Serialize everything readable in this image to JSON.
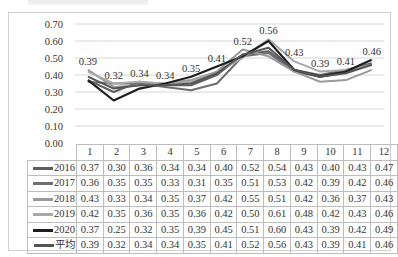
{
  "chart_data": {
    "type": "line",
    "title": "",
    "xlabel": "",
    "ylabel": "",
    "ylim": [
      0,
      0.7
    ],
    "yticks": [
      "0.70",
      "0.60",
      "0.50",
      "0.40",
      "0.30",
      "0.20",
      "0.10",
      "0.00"
    ],
    "grid": true,
    "legend_position": "data-table (bottom)",
    "categories": [
      "1",
      "2",
      "3",
      "4",
      "5",
      "6",
      "7",
      "8",
      "9",
      "10",
      "11",
      "12"
    ],
    "series": [
      {
        "name": "2016",
        "color": "#5f5f5f",
        "values": [
          0.37,
          0.3,
          0.36,
          0.34,
          0.34,
          0.4,
          0.52,
          0.54,
          0.43,
          0.4,
          0.43,
          0.47
        ]
      },
      {
        "name": "2017",
        "color": "#6e6e6e",
        "values": [
          0.36,
          0.35,
          0.35,
          0.33,
          0.31,
          0.35,
          0.51,
          0.53,
          0.42,
          0.39,
          0.42,
          0.46
        ]
      },
      {
        "name": "2018",
        "color": "#9a9a9a",
        "values": [
          0.43,
          0.33,
          0.34,
          0.35,
          0.37,
          0.42,
          0.55,
          0.51,
          0.42,
          0.36,
          0.37,
          0.43
        ]
      },
      {
        "name": "2019",
        "color": "#a8a8a8",
        "values": [
          0.42,
          0.35,
          0.36,
          0.35,
          0.36,
          0.42,
          0.5,
          0.61,
          0.48,
          0.42,
          0.43,
          0.46
        ]
      },
      {
        "name": "2020",
        "color": "#1e1e1e",
        "values": [
          0.37,
          0.25,
          0.32,
          0.35,
          0.39,
          0.45,
          0.51,
          0.6,
          0.43,
          0.39,
          0.42,
          0.49
        ]
      },
      {
        "name": "平均",
        "color": "#555555",
        "values": [
          0.39,
          0.32,
          0.34,
          0.34,
          0.35,
          0.41,
          0.52,
          0.56,
          0.43,
          0.39,
          0.41,
          0.46
        ]
      }
    ],
    "data_labels": {
      "series": "平均",
      "values": [
        "0.39",
        "0.32",
        "0.34",
        "0.34",
        "0.35",
        "0.41",
        "0.52",
        "0.56",
        "0.43",
        "0.39",
        "0.41",
        "0.46"
      ]
    }
  },
  "table": {
    "header": [
      "1",
      "2",
      "3",
      "4",
      "5",
      "6",
      "7",
      "8",
      "9",
      "10",
      "11",
      "12"
    ],
    "rows": [
      {
        "label": "2016",
        "cells": [
          "0.37",
          "0.30",
          "0.36",
          "0.34",
          "0.34",
          "0.40",
          "0.52",
          "0.54",
          "0.43",
          "0.40",
          "0.43",
          "0.47"
        ]
      },
      {
        "label": "2017",
        "cells": [
          "0.36",
          "0.35",
          "0.35",
          "0.33",
          "0.31",
          "0.35",
          "0.51",
          "0.53",
          "0.42",
          "0.39",
          "0.42",
          "0.46"
        ]
      },
      {
        "label": "2018",
        "cells": [
          "0.43",
          "0.33",
          "0.34",
          "0.35",
          "0.37",
          "0.42",
          "0.55",
          "0.51",
          "0.42",
          "0.36",
          "0.37",
          "0.43"
        ]
      },
      {
        "label": "2019",
        "cells": [
          "0.42",
          "0.35",
          "0.36",
          "0.35",
          "0.36",
          "0.42",
          "0.50",
          "0.61",
          "0.48",
          "0.42",
          "0.43",
          "0.46"
        ]
      },
      {
        "label": "2020",
        "cells": [
          "0.37",
          "0.25",
          "0.32",
          "0.35",
          "0.39",
          "0.45",
          "0.51",
          "0.60",
          "0.43",
          "0.39",
          "0.42",
          "0.49"
        ]
      },
      {
        "label": "平均",
        "cells": [
          "0.39",
          "0.32",
          "0.34",
          "0.34",
          "0.35",
          "0.41",
          "0.52",
          "0.56",
          "0.43",
          "0.39",
          "0.41",
          "0.46"
        ]
      }
    ]
  }
}
